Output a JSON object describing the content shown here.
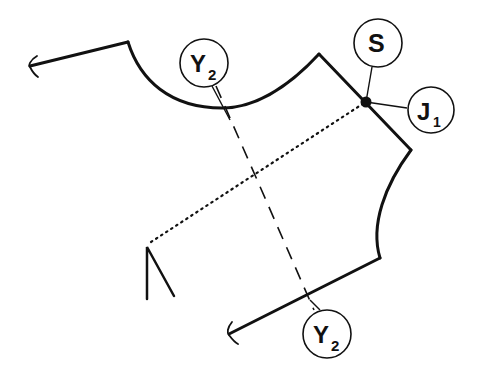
{
  "diagram": {
    "type": "pattern-piece",
    "stroke_color": "#111111",
    "background": "#ffffff",
    "labels": {
      "y2_top": {
        "main": "Y",
        "sub": "2"
      },
      "y2_bottom": {
        "main": "Y",
        "sub": "2"
      },
      "s": {
        "main": "S",
        "sub": ""
      },
      "j1": {
        "main": "J",
        "sub": "1"
      }
    },
    "lines": {
      "outline": "solid",
      "centerline": "dashed",
      "guideline": "dotted"
    }
  }
}
